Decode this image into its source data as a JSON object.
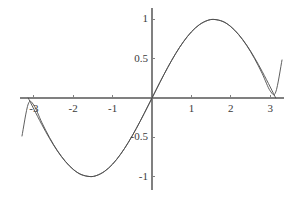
{
  "figure": {
    "background_color": "#ffffff",
    "width": 298,
    "height": 198
  },
  "chart_data": {
    "type": "line",
    "title": "",
    "subtitle": "",
    "xlabel": "",
    "ylabel": "",
    "grid": false,
    "legend": "none",
    "axis_style": "centered-cross",
    "axis_color": "#808080",
    "xlim": [
      -3.3,
      3.3
    ],
    "ylim": [
      -1.15,
      1.12
    ],
    "xticks": [
      -3,
      -2,
      -1,
      1,
      2,
      3
    ],
    "xtick_labels": [
      "-3",
      "-2",
      "-1",
      "1",
      "2",
      "3"
    ],
    "yticks": [
      -1,
      -0.5,
      0.5,
      1
    ],
    "ytick_labels": [
      "-1",
      "-0.5",
      "0.5",
      "1"
    ],
    "series": [
      {
        "name": "sin(x)",
        "color": "#4d4d4d",
        "line_width": 0.9,
        "expression": "sin(x)",
        "x": [
          -3.14159,
          -3.0,
          -2.8,
          -2.6,
          -2.4,
          -2.2,
          -2.0,
          -1.8,
          -1.5708,
          -1.4,
          -1.2,
          -1.0,
          -0.8,
          -0.6,
          -0.4,
          -0.2,
          0.0,
          0.2,
          0.4,
          0.6,
          0.8,
          1.0,
          1.2,
          1.4,
          1.5708,
          1.8,
          2.0,
          2.2,
          2.4,
          2.6,
          2.8,
          3.0,
          3.14159
        ],
        "y": [
          0.0,
          -0.1411,
          -0.335,
          -0.5155,
          -0.6755,
          -0.8085,
          -0.9093,
          -0.9738,
          -1.0,
          -0.9854,
          -0.932,
          -0.8415,
          -0.7174,
          -0.5646,
          -0.3894,
          -0.1987,
          0.0,
          0.1987,
          0.3894,
          0.5646,
          0.7174,
          0.8415,
          0.932,
          0.9854,
          1.0,
          0.9738,
          0.9093,
          0.8085,
          0.6755,
          0.5155,
          0.335,
          0.1411,
          0.0
        ]
      },
      {
        "name": "taylor-approximation",
        "color": "#4d4d4d",
        "line_width": 0.9,
        "expression": "x - x^3/6 + x^5/120 - x^7/5040",
        "x": [
          -3.3,
          -3.14159,
          -3.0,
          -2.8,
          -2.6,
          -2.4,
          -2.2,
          -2.0,
          -1.8,
          -1.5708,
          -1.4,
          -1.2,
          -1.0,
          -0.8,
          -0.6,
          -0.4,
          -0.2,
          0.0,
          0.2,
          0.4,
          0.6,
          0.8,
          1.0,
          1.2,
          1.4,
          1.5708,
          1.8,
          2.0,
          2.2,
          2.4,
          2.6,
          2.8,
          3.0,
          3.14159,
          3.3
        ],
        "y": [
          -0.4837,
          -0.0752,
          -0.0911,
          -0.3082,
          -0.5043,
          -0.6706,
          -0.8052,
          -0.9079,
          -0.9736,
          -1.0,
          -0.9854,
          -0.932,
          -0.8415,
          -0.7174,
          -0.5646,
          -0.3894,
          -0.1987,
          0.0,
          0.1987,
          0.3894,
          0.5646,
          0.7174,
          0.8415,
          0.932,
          0.9854,
          1.0,
          0.9736,
          0.9079,
          0.8052,
          0.6706,
          0.5043,
          0.3082,
          0.0911,
          0.0752,
          0.4837
        ]
      }
    ]
  }
}
